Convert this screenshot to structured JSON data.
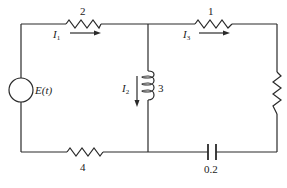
{
  "diagram": {
    "type": "electrical-circuit",
    "components": {
      "source": {
        "label": "E(t)"
      },
      "resistor_top_left": {
        "label": "2"
      },
      "resistor_top_right": {
        "label": "1"
      },
      "inductor_middle": {
        "label": "3"
      },
      "resistor_bottom_left": {
        "label": "4"
      },
      "capacitor_bottom_right": {
        "label": "0.2"
      },
      "resistor_right": {
        "label": ""
      }
    },
    "currents": {
      "i1": {
        "symbol": "I",
        "subscript": "1"
      },
      "i2": {
        "symbol": "I",
        "subscript": "2"
      },
      "i3": {
        "symbol": "I",
        "subscript": "3"
      }
    }
  }
}
